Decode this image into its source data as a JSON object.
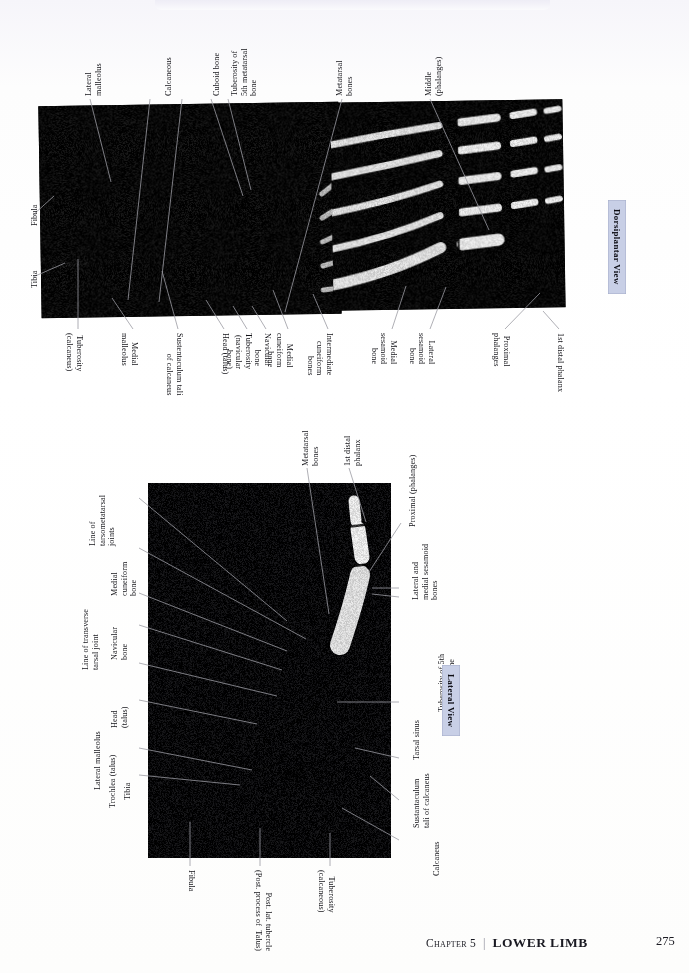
{
  "page": {
    "footer": {
      "chapter_label": "Chapter 5",
      "separator": "|",
      "section_title": "LOWER LIMB",
      "page_number": "275"
    },
    "colors": {
      "badge_background": "#c8cfe6",
      "label_text": "#131318",
      "leader_line": "#9a9aa2",
      "plate_background": "#000000"
    }
  },
  "figures": [
    {
      "id": "dorsiplantar-foot-xray",
      "badge": "Dorsiplantar View",
      "labels_top": [
        {
          "text": "Lateral\nmalleolus"
        },
        {
          "text": "Calcaneous"
        },
        {
          "text": "Cuboid bone"
        },
        {
          "text": "Tuberosity of\n5th metatarsal\nbone"
        },
        {
          "text": "Metatarsal\nbones"
        },
        {
          "text": "Middle\n(phalanges)"
        }
      ],
      "labels_left": [
        {
          "text": "Fibula"
        },
        {
          "text": "Tibia"
        }
      ],
      "labels_bottom": [
        {
          "text": "Tuberosity\n(calcaneus)"
        },
        {
          "text": "Medial\nmalleolus"
        },
        {
          "text": "Sustentaculum tali\nof calcaneus"
        },
        {
          "text": "Head (talus)"
        },
        {
          "text": "Tuberosity\n(navicular\nbone)"
        },
        {
          "text": "Navicular\nbone"
        },
        {
          "text": "Medial\ncuneiform\nbone"
        },
        {
          "text": "Intermediate\ncuneiform\nbones"
        },
        {
          "text": "Medial\nsesamoid\nbone"
        },
        {
          "text": "Lateral\nsesamoid\nbone"
        },
        {
          "text": "Proximal\nphalanges"
        },
        {
          "text": "1st distal phalanx"
        }
      ]
    },
    {
      "id": "lateral-foot-xray",
      "badge": "Lateral View",
      "labels_left": [
        {
          "text": "Line of\ntarsometatarsal\njoints"
        },
        {
          "text": "Medial\ncuneiform\nbone"
        },
        {
          "text": "Line of transverse\ntarsal joint"
        },
        {
          "text": "Navicular\nbone"
        },
        {
          "text": "Head\n(talus)"
        },
        {
          "text": "Lateral malleolus"
        },
        {
          "text": "Trochlea (talus)"
        },
        {
          "text": "Tibia"
        }
      ],
      "labels_top": [
        {
          "text": "Metatarsal\nbones"
        },
        {
          "text": "1st distal\nphalanx"
        },
        {
          "text": "Proximal (phalanges)"
        }
      ],
      "labels_right": [
        {
          "text": "Lateral and\nmedial sesamoid\nbones"
        },
        {
          "text": "Tuberosity of 5th\nmetatarsal bone"
        },
        {
          "text": "Tarsal sinus"
        },
        {
          "text": "Sustantaculum\ntali of calcaneus"
        },
        {
          "text": "Calcaneus"
        }
      ],
      "labels_bottom": [
        {
          "text": "Fibula"
        },
        {
          "text": "Post. lat. tubercle\n(Post. process of  Talus)"
        },
        {
          "text": "Tuberosity\n(calcaneous)"
        }
      ]
    }
  ]
}
